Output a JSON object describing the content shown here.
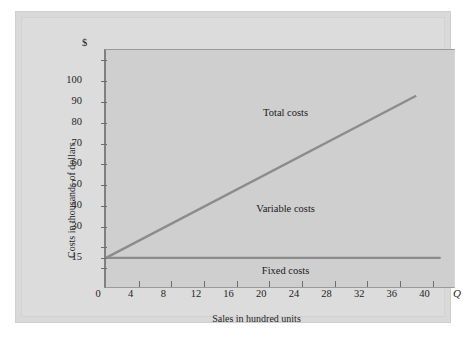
{
  "chart_data": {
    "type": "line",
    "title": "",
    "subtitle": "",
    "xlabel": "Sales in hundred units",
    "ylabel": "Costs in thousands of dollars",
    "x_axis_symbol": "Q",
    "y_axis_symbol": "$",
    "xlim": [
      0,
      43
    ],
    "ylim": [
      0,
      115
    ],
    "grid": false,
    "legend_position": "inline-annotations",
    "xticks": [
      {
        "value": 0,
        "label": "0"
      },
      {
        "value": 4,
        "label": "4"
      },
      {
        "value": 8,
        "label": "8"
      },
      {
        "value": 12,
        "label": "12"
      },
      {
        "value": 16,
        "label": "16"
      },
      {
        "value": 20,
        "label": "20"
      },
      {
        "value": 24,
        "label": "24"
      },
      {
        "value": 28,
        "label": "28"
      },
      {
        "value": 32,
        "label": "32"
      },
      {
        "value": 36,
        "label": "36"
      },
      {
        "value": 40,
        "label": "40"
      }
    ],
    "yticks": [
      {
        "value": 110,
        "label": ""
      },
      {
        "value": 100,
        "label": "100"
      },
      {
        "value": 90,
        "label": "90"
      },
      {
        "value": 80,
        "label": "80"
      },
      {
        "value": 70,
        "label": "70"
      },
      {
        "value": 60,
        "label": "60"
      },
      {
        "value": 50,
        "label": "50"
      },
      {
        "value": 40,
        "label": "40"
      },
      {
        "value": 30,
        "label": "30"
      },
      {
        "value": 20,
        "label": ""
      },
      {
        "value": 15,
        "label": "15"
      },
      {
        "value": 10,
        "label": ""
      }
    ],
    "series": [
      {
        "name": "Total costs",
        "label": "Total costs",
        "color": "#8c8c8c",
        "points": [
          [
            0,
            15
          ],
          [
            38,
            93
          ]
        ],
        "label_x": 22,
        "label_y": 84
      },
      {
        "name": "Fixed costs",
        "label": "Fixed costs",
        "color": "#8c8c8c",
        "points": [
          [
            0,
            15
          ],
          [
            41,
            15
          ]
        ],
        "label_x": 22,
        "label_y": 8
      },
      {
        "name": "Variable costs",
        "label": "Variable costs",
        "color": "#8c8c8c",
        "points": [],
        "label_x": 22,
        "label_y": 38
      }
    ],
    "annotations": [
      {
        "text": "Total costs"
      },
      {
        "text": "Variable costs"
      },
      {
        "text": "Fixed costs"
      }
    ],
    "colors": {
      "line": "#8c8c8c",
      "axis": "#6e6e6e",
      "plot_bg": "#cfcfcf",
      "panel_bg": "#dcdcdc",
      "text": "#1e1e1e"
    }
  }
}
